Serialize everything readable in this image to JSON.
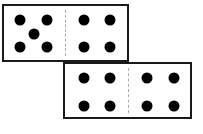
{
  "dominoes": [
    {
      "name": "top-domino",
      "box": {
        "x": 2,
        "y": 4,
        "w": 127,
        "h": 58
      },
      "divider_x": 61,
      "halves": [
        {
          "pips": 5,
          "dots": [
            [
              16,
              14
            ],
            [
              43,
              14
            ],
            [
              30,
              28
            ],
            [
              16,
              41
            ],
            [
              43,
              41
            ]
          ]
        },
        {
          "pips": 4,
          "dots": [
            [
              80,
              14
            ],
            [
              106,
              14
            ],
            [
              80,
              41
            ],
            [
              106,
              41
            ]
          ]
        }
      ]
    },
    {
      "name": "bottom-domino",
      "box": {
        "x": 63,
        "y": 62,
        "w": 129,
        "h": 57
      },
      "divider_x": 63,
      "halves": [
        {
          "pips": 4,
          "dots": [
            [
              19,
              14
            ],
            [
              45,
              14
            ],
            [
              19,
              42
            ],
            [
              45,
              42
            ]
          ]
        },
        {
          "pips": 4,
          "dots": [
            [
              82,
              14
            ],
            [
              109,
              14
            ],
            [
              82,
              42
            ],
            [
              109,
              42
            ]
          ]
        }
      ]
    }
  ],
  "colors": {
    "border": "#1a1a1a",
    "dot": "#000000",
    "divider": "#aaaaaa",
    "background": "#ffffff"
  }
}
